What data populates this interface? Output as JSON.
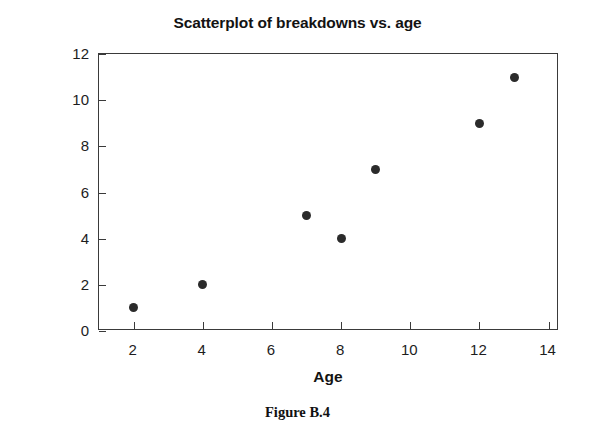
{
  "chart_data": {
    "type": "scatter",
    "title": "Scatterplot of breakdowns vs. age",
    "xlabel": "Age",
    "ylabel": "Breakdowns",
    "x": [
      2,
      4,
      7,
      8,
      9,
      12,
      13
    ],
    "y": [
      1,
      2,
      5,
      4,
      7,
      9,
      11
    ],
    "points": [
      {
        "x": 2,
        "y": 1
      },
      {
        "x": 4,
        "y": 2
      },
      {
        "x": 7,
        "y": 5
      },
      {
        "x": 8,
        "y": 4
      },
      {
        "x": 9,
        "y": 7
      },
      {
        "x": 12,
        "y": 9
      },
      {
        "x": 13,
        "y": 11
      }
    ],
    "xlim": [
      1.0,
      14.3
    ],
    "ylim": [
      0,
      12
    ],
    "xticks": [
      2,
      4,
      6,
      8,
      10,
      12,
      14
    ],
    "yticks": [
      0,
      2,
      4,
      6,
      8,
      10,
      12
    ],
    "xtick_labels": [
      "2",
      "4",
      "6",
      "8",
      "10",
      "12",
      "14"
    ],
    "ytick_labels": [
      "0",
      "2",
      "4",
      "6",
      "8",
      "10",
      "12"
    ],
    "grid": false,
    "legend": null,
    "marker": "filled-circle",
    "marker_color": "#2b2b2b",
    "axis_color": "#3a3a3a",
    "background": "#ffffff"
  },
  "caption": {
    "text": "Figure B.4"
  }
}
